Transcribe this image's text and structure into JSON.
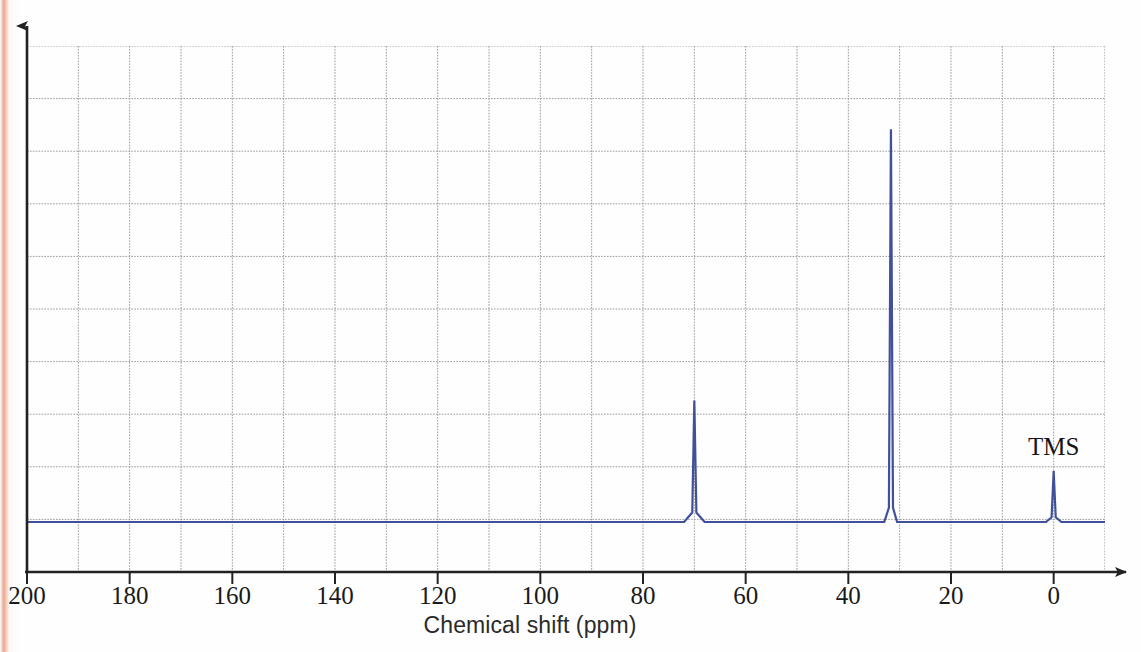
{
  "figure": {
    "title": "",
    "x_axis_title": "Chemical shift (ppm)",
    "line_color": "#41509a",
    "grid_color": "#9a9a9a",
    "axis_color": "#222222"
  },
  "axis": {
    "tick_labels": [
      "200",
      "180",
      "160",
      "140",
      "120",
      "100",
      "80",
      "60",
      "40",
      "20",
      "0"
    ],
    "tick_values": [
      200,
      180,
      160,
      140,
      120,
      100,
      80,
      60,
      40,
      20,
      0
    ],
    "minor_tick_step_ppm": 10,
    "range_left_ppm": 200,
    "range_right_ppm": -10
  },
  "annotations": [
    {
      "text": "TMS",
      "ppm": 0
    }
  ],
  "chart_data": {
    "type": "line",
    "xlabel": "Chemical shift (ppm)",
    "ylabel": "",
    "xlim": [
      200,
      -10
    ],
    "x_reversed": true,
    "grid": true,
    "legend": "none",
    "baseline_intensity": 0,
    "ylim": [
      0,
      1
    ],
    "peaks": [
      {
        "ppm": 70.0,
        "intensity": 0.255,
        "label": ""
      },
      {
        "ppm": 31.7,
        "intensity": 0.825,
        "label": ""
      },
      {
        "ppm": 0.0,
        "intensity": 0.107,
        "label": "TMS"
      }
    ],
    "annotations": [
      {
        "text": "TMS",
        "x": 0,
        "y": 0.145
      }
    ],
    "x_ticks": [
      200,
      180,
      160,
      140,
      120,
      100,
      80,
      60,
      40,
      20,
      0
    ],
    "x_minor_ticks": [
      190,
      170,
      150,
      130,
      110,
      90,
      70,
      50,
      30,
      10
    ],
    "y_ticks": [],
    "series": [
      {
        "name": "13C NMR trace",
        "color": "#41509a",
        "x": [
          200,
          72,
          70.4,
          70.0,
          69.6,
          68,
          33,
          32.1,
          31.7,
          31.3,
          30.5,
          1.5,
          0.4,
          0.0,
          -0.4,
          -1.5,
          -10
        ],
        "values": [
          0,
          0,
          0.02,
          0.255,
          0.02,
          0,
          0,
          0.03,
          0.825,
          0.03,
          0,
          0,
          0.01,
          0.107,
          0.01,
          0,
          0
        ]
      }
    ]
  }
}
